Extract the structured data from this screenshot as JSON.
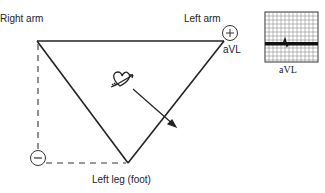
{
  "diagram": {
    "labels": {
      "right_arm": "Right arm",
      "left_arm": "Left arm",
      "left_leg": "Left leg (foot)",
      "lead_name": "aVL",
      "strip_caption": "aVL"
    },
    "electrodes": {
      "positive": {
        "symbol": "+",
        "location": "Left arm"
      },
      "negative": {
        "symbol": "−",
        "location": "Right arm + Left leg (combined)"
      }
    },
    "ecg_strip": {
      "lead": "aVL",
      "description": "Mostly flat, low-amplitude tracing"
    },
    "colors": {
      "line": "#222222",
      "grid": "#555555",
      "background": "#ffffff"
    }
  }
}
